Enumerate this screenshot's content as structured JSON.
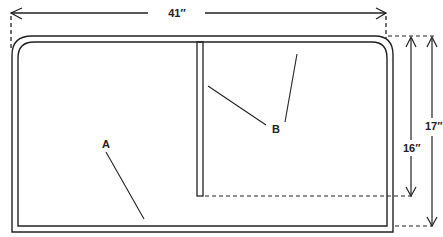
{
  "figure": {
    "caption_fragment": "..Fig. 5 (cropped)",
    "title": "",
    "colors": {
      "line": "#222222",
      "background": "#ffffff"
    }
  },
  "dimensions": {
    "width": {
      "label": "41″",
      "value_in": 41
    },
    "inner_height": {
      "label": "16″",
      "value_in": 16
    },
    "outer_height": {
      "label": "17″",
      "value_in": 17
    }
  },
  "callouts": {
    "a": {
      "label": "A",
      "description": "outer frame / panel"
    },
    "b": {
      "label": "B",
      "description": "vertical divider strip"
    }
  }
}
